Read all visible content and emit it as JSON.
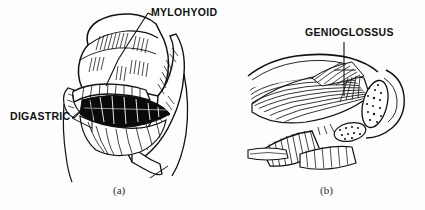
{
  "figure": {
    "type": "anatomical-line-drawing",
    "background_color": "#fdfdfc",
    "ink_color": "#111111",
    "panels": [
      {
        "id": "a",
        "caption": "(a)",
        "subject": "mylohyoid and digastric muscles",
        "labels": [
          "MYLOHYOID",
          "DIGASTRIC"
        ]
      },
      {
        "id": "b",
        "caption": "(b)",
        "subject": "genioglossus muscle",
        "labels": [
          "GENIOGLOSSUS"
        ]
      }
    ]
  },
  "labels": {
    "mylohyoid": "MYLOHYOID",
    "digastric": "DIGASTRIC",
    "genioglossus": "GENIOGLOSSUS"
  },
  "captions": {
    "panel_a": "(a)",
    "panel_b": "(b)"
  }
}
